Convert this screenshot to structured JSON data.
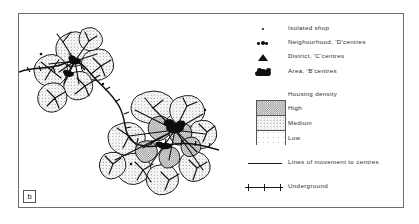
{
  "figure": {
    "panel_label": "b",
    "frame_color": "#6e6e6e",
    "background": "#ffffff",
    "ink_color": "#1a1a1a"
  },
  "legend": {
    "symbol_items": [
      {
        "icon": "isolated-shop-dot-icon",
        "label": "Isolated shop"
      },
      {
        "icon": "neighbourhood-centre-cluster-icon",
        "label": "Neighourhood, 'D'centres"
      },
      {
        "icon": "district-centre-triangle-icon",
        "label": "District, 'C'centres"
      },
      {
        "icon": "area-centre-blob-icon",
        "label": "Area, 'B'centres"
      }
    ],
    "density": {
      "title": "Housing density",
      "levels": [
        {
          "label": "High",
          "fill": "dense-stipple"
        },
        {
          "label": "Medium",
          "fill": "medium-stipple"
        },
        {
          "label": "Low",
          "fill": "sparse-stipple"
        }
      ]
    },
    "line_items": [
      {
        "icon": "movement-line-icon",
        "label": "Lines of movement to centres"
      },
      {
        "icon": "underground-line-icon",
        "label": "Underground"
      }
    ]
  },
  "map": {
    "description": "Schematic settlement map of stippled neighbourhood cells clustered around district and area centres, linked by movement lines and an underground route",
    "clusters": [
      {
        "name": "north-west-cluster",
        "centre_type": "district",
        "cells": 6
      },
      {
        "name": "south-east-cluster",
        "centre_type": "area",
        "cells": 13
      }
    ]
  }
}
